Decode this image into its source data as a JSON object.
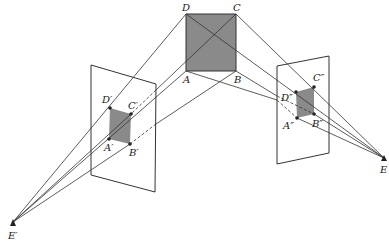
{
  "diagram": {
    "type": "perspective-projection",
    "colors": {
      "line": "#333333",
      "shade": "#8a8a8a",
      "background": "#ffffff"
    },
    "object_square": {
      "labels": {
        "A": "A",
        "B": "B",
        "C": "C",
        "D": "D"
      },
      "points": {
        "D": [
          186,
          14
        ],
        "C": [
          236,
          14
        ],
        "A": [
          186,
          71
        ],
        "B": [
          236,
          71
        ]
      }
    },
    "eyes": {
      "left": {
        "label": "E′",
        "point": [
          13,
          222
        ]
      },
      "right": {
        "label": "E",
        "point": [
          384,
          158
        ]
      }
    },
    "left_plane": {
      "corners": [
        [
          91,
          65
        ],
        [
          156,
          84
        ],
        [
          155,
          192
        ],
        [
          91,
          175
        ]
      ],
      "labels": {
        "A": "A′",
        "B": "B′",
        "C": "C′",
        "D": "D′"
      },
      "points": {
        "D": [
          110,
          108
        ],
        "C": [
          131,
          114
        ],
        "A": [
          109,
          139
        ],
        "B": [
          130,
          144
        ]
      }
    },
    "right_plane": {
      "corners": [
        [
          277,
          66
        ],
        [
          329,
          56
        ],
        [
          329,
          153
        ],
        [
          277,
          164
        ]
      ],
      "labels": {
        "A": "A″",
        "B": "B″",
        "C": "C″",
        "D": "D″"
      },
      "points": {
        "D": [
          296,
          92
        ],
        "C": [
          314,
          87
        ],
        "A": [
          297,
          118
        ],
        "B": [
          314,
          114
        ]
      }
    }
  }
}
